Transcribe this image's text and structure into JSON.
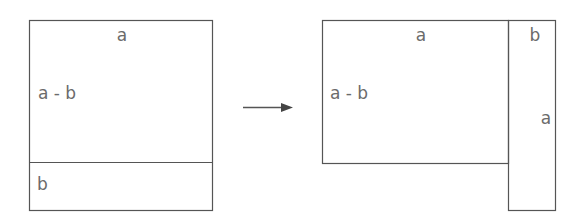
{
  "diagram": {
    "left": {
      "top_label": "a",
      "side_label": "a - b",
      "bottom_label": "b"
    },
    "arrow": {
      "direction": "right"
    },
    "right": {
      "main_top_label": "a",
      "main_side_label": "a - b",
      "strip_top_label": "b",
      "strip_side_label": "a"
    },
    "colors": {
      "stroke": "#555555",
      "text": "#6b6b6b",
      "background": "#ffffff"
    }
  }
}
